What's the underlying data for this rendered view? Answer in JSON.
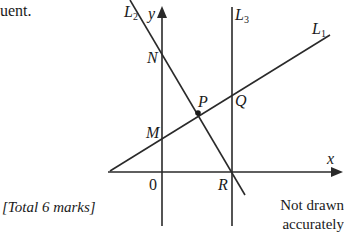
{
  "question": {
    "intro_fragment": "uent.",
    "total_marks": "[Total 6 marks]",
    "note_line1": "Not drawn",
    "note_line2": "accurately"
  },
  "diagram": {
    "axes": {
      "x_label": "x",
      "y_label": "y",
      "origin_label": "0"
    },
    "lines": [
      {
        "id": "L1",
        "label_main": "L",
        "label_sub": "1",
        "description": "line with positive gradient crossing y-axis at M and L3 at Q"
      },
      {
        "id": "L2",
        "label_main": "L",
        "label_sub": "2",
        "description": "line with negative gradient through N and R"
      },
      {
        "id": "L3",
        "label_main": "L",
        "label_sub": "3",
        "description": "vertical line through Q and R"
      }
    ],
    "points": {
      "N": "N",
      "P": "P",
      "Q": "Q",
      "M": "M",
      "R": "R"
    },
    "stroke_color": "#2a2a2a"
  }
}
